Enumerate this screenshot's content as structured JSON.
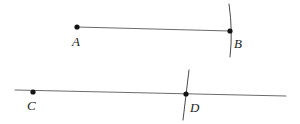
{
  "figure": {
    "background_color": "#ffffff",
    "width": 300,
    "height": 124,
    "stroke_color": "#6b6b6b",
    "tick_color": "#4a4a4a",
    "point_color": "#141414",
    "label_color": "#1c1c1c"
  },
  "shapes": {
    "upper": {
      "name": "segment-AB",
      "kind": "segment",
      "x1": 77,
      "y1": 27,
      "x2": 230,
      "y2": 31
    },
    "lower": {
      "name": "line-CD",
      "kind": "line",
      "x1": 15,
      "y1": 90,
      "x2": 286,
      "y2": 96
    }
  },
  "ticks": [
    {
      "name": "tick-at-B",
      "path": "M 229 4 Q 233 31 230 57"
    },
    {
      "name": "tick-at-D",
      "path": "M 189 70 Q 186 95 183 120"
    }
  ],
  "points": [
    {
      "id": "A",
      "label": "A",
      "x": 77,
      "y": 27,
      "label_x": 72,
      "label_y": 46,
      "radius": 2.6
    },
    {
      "id": "B",
      "label": "B",
      "x": 230,
      "y": 31,
      "label_x": 234,
      "label_y": 48,
      "radius": 2.6
    },
    {
      "id": "C",
      "label": "C",
      "x": 33,
      "y": 92,
      "label_x": 27,
      "label_y": 110,
      "radius": 2.6
    },
    {
      "id": "D",
      "label": "D",
      "x": 186,
      "y": 94,
      "label_x": 190,
      "label_y": 112,
      "radius": 2.6
    }
  ]
}
